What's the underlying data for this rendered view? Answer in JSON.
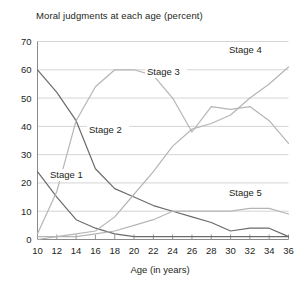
{
  "chart_data": {
    "type": "line",
    "title": "Moral judgments at each age (percent)",
    "xlabel": "Age (in years)",
    "ylabel": "",
    "xlim": [
      10,
      36
    ],
    "ylim": [
      0,
      70
    ],
    "ytick_step": 10,
    "xtick_step": 2,
    "grid": true,
    "legend": "inline-labels",
    "xticks": [
      10,
      12,
      14,
      16,
      18,
      20,
      22,
      24,
      26,
      28,
      30,
      32,
      34,
      36
    ],
    "yticks": [
      0,
      10,
      20,
      30,
      40,
      50,
      60,
      70
    ],
    "x": [
      10,
      12,
      14,
      16,
      18,
      20,
      22,
      24,
      26,
      28,
      30,
      32,
      34,
      36
    ],
    "series": [
      {
        "name": "Stage 1",
        "label": "Stage 1",
        "color": "#6b6b6b",
        "label_x": 50,
        "label_y": 178,
        "values": [
          24,
          15,
          7,
          4,
          2,
          1,
          1,
          1,
          1,
          1,
          1,
          1,
          1,
          1
        ]
      },
      {
        "name": "Stage 2",
        "label": "Stage 2",
        "color": "#6b6b6b",
        "label_x": 89,
        "label_y": 133,
        "values": [
          60,
          52,
          42,
          25,
          18,
          15,
          12,
          10,
          8,
          6,
          3,
          4,
          4,
          1
        ]
      },
      {
        "name": "Stage 3",
        "label": "Stage 3",
        "color": "#b5b5b5",
        "label_x": 147,
        "label_y": 75,
        "values": [
          2,
          17,
          42,
          54,
          60,
          60,
          58,
          50,
          38,
          47,
          46,
          47,
          42,
          34
        ]
      },
      {
        "name": "Stage 4",
        "label": "Stage 4",
        "color": "#b5b5b5",
        "label_x": 229,
        "label_y": 53,
        "values": [
          1,
          1,
          2,
          3,
          8,
          16,
          24,
          33,
          39,
          41,
          44,
          50,
          55,
          61
        ]
      },
      {
        "name": "Stage 5",
        "label": "Stage 5",
        "color": "#b5b5b5",
        "label_x": 229,
        "label_y": 196,
        "values": [
          0,
          1,
          1,
          2,
          3,
          5,
          7,
          10,
          10,
          10,
          10,
          11,
          11,
          9
        ]
      }
    ]
  }
}
